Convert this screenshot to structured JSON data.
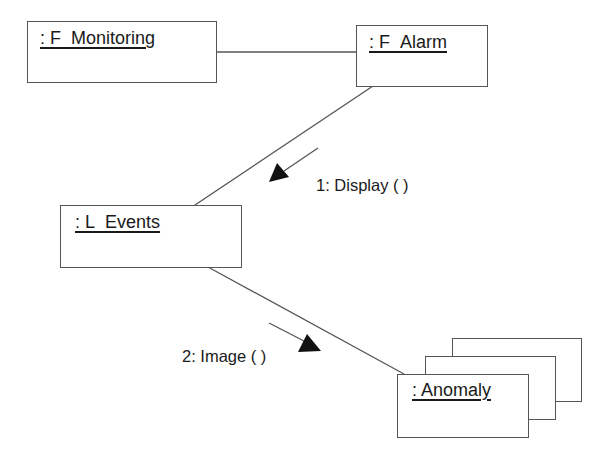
{
  "diagram": {
    "type": "UML collaboration diagram",
    "objects": [
      {
        "id": "f_monitoring",
        "label": ": F_Monitoring",
        "multi": false
      },
      {
        "id": "f_alarm",
        "label": ": F_Alarm",
        "multi": false
      },
      {
        "id": "l_events",
        "label": ": L_Events",
        "multi": false
      },
      {
        "id": "anomaly",
        "label": ": Anomaly",
        "multi": true
      }
    ],
    "links": [
      {
        "from": "f_monitoring",
        "to": "f_alarm"
      },
      {
        "from": "f_alarm",
        "to": "l_events"
      },
      {
        "from": "l_events",
        "to": "anomaly"
      }
    ],
    "messages": [
      {
        "sequence": "1",
        "label": "1: Display ( )",
        "from": "f_alarm",
        "to": "l_events"
      },
      {
        "sequence": "2",
        "label": "2: Image ( )",
        "from": "l_events",
        "to": "anomaly"
      }
    ],
    "colors": {
      "line": "#555555",
      "arrowhead": "#111111",
      "background": "#ffffff",
      "text": "#1a1a1a"
    }
  }
}
